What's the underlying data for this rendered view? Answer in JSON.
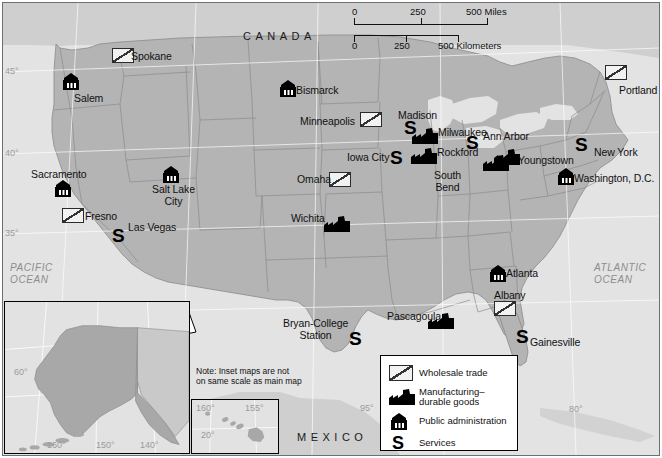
{
  "map": {
    "title": "United States employment-sector reference map",
    "regions": [
      {
        "name": "CANADA",
        "x": 243,
        "y": 30
      },
      {
        "name": "MEXICO",
        "x": 297,
        "y": 431
      }
    ],
    "oceans": [
      {
        "name": "PACIFIC\nOCEAN",
        "x": 10,
        "y": 262
      },
      {
        "name": "ATLANTIC\nOCEAN",
        "x": 594,
        "y": 262
      }
    ],
    "graticule_labels": [
      {
        "text": "45°",
        "x": 5,
        "y": 66
      },
      {
        "text": "40°",
        "x": 5,
        "y": 148
      },
      {
        "text": "35°",
        "x": 5,
        "y": 228
      },
      {
        "text": "95°",
        "x": 360,
        "y": 403
      },
      {
        "text": "80°",
        "x": 569,
        "y": 404
      }
    ],
    "colors": {
      "land": "#b4b4b4",
      "land_neighbor": "#cfcfcf",
      "water": "#e3e3e3",
      "border": "#8a8a8a",
      "symbol": "#000000"
    }
  },
  "scalebar": {
    "miles": {
      "zero": "0",
      "mid": "250",
      "end": "500 Miles"
    },
    "kilometers": {
      "zero": "0",
      "mid": "250",
      "end": "500 Kilometers"
    }
  },
  "legend": {
    "items": [
      {
        "icon": "wholesale-trade-icon",
        "label": "Wholesale trade"
      },
      {
        "icon": "manufacturing-durable-goods-icon",
        "label": "Manufacturing–\ndurable goods"
      },
      {
        "icon": "public-administration-icon",
        "label": "Public administration"
      },
      {
        "icon": "services-icon",
        "label": "Services"
      }
    ]
  },
  "insets": {
    "note": "Note: Inset maps are not\non same scale as main map",
    "alaska": {
      "name": "Alaska",
      "graticule_labels": [
        {
          "text": "60°",
          "x": 14,
          "y": 367
        },
        {
          "text": "160°",
          "x": 47,
          "y": 440
        },
        {
          "text": "150°",
          "x": 96,
          "y": 440
        },
        {
          "text": "140°",
          "x": 140,
          "y": 440
        }
      ]
    },
    "hawaii": {
      "name": "Hawaii",
      "graticule_labels": [
        {
          "text": "160°",
          "x": 196,
          "y": 403
        },
        {
          "text": "155°",
          "x": 245,
          "y": 403
        },
        {
          "text": "20°",
          "x": 201,
          "y": 430
        }
      ]
    }
  },
  "cities": [
    {
      "name": "Spokane",
      "category": "wholesale",
      "label_x": 131,
      "label_y": 51,
      "sym_x": 112,
      "sym_y": 48
    },
    {
      "name": "Salem",
      "category": "public",
      "label_x": 74,
      "label_y": 93,
      "sym_x": 61,
      "sym_y": 73
    },
    {
      "name": "Portland",
      "category": "wholesale",
      "label_x": 619,
      "label_y": 85,
      "sym_x": 605,
      "sym_y": 65
    },
    {
      "name": "Bismarck",
      "category": "public",
      "label_x": 296,
      "label_y": 85,
      "sym_x": 278,
      "sym_y": 80
    },
    {
      "name": "Minneapolis",
      "category": "wholesale",
      "label_x": 300,
      "label_y": 116,
      "sym_x": 360,
      "sym_y": 112
    },
    {
      "name": "Madison",
      "category": "services",
      "label_x": 398,
      "label_y": 110,
      "sym_x": 404,
      "sym_y": 118
    },
    {
      "name": "Milwaukee",
      "category": "manufacturing",
      "label_x": 438,
      "label_y": 127,
      "sym_x": 412,
      "sym_y": 128
    },
    {
      "name": "Ann Arbor",
      "category": "services",
      "label_x": 483,
      "label_y": 131,
      "sym_x": 466,
      "sym_y": 133
    },
    {
      "name": "New York",
      "category": "services",
      "label_x": 594,
      "label_y": 147,
      "sym_x": 575,
      "sym_y": 135
    },
    {
      "name": "Iowa City",
      "category": "services",
      "label_x": 347,
      "label_y": 152,
      "sym_x": 390,
      "sym_y": 148
    },
    {
      "name": "Rockford",
      "category": "manufacturing",
      "label_x": 437,
      "label_y": 147,
      "sym_x": 411,
      "sym_y": 148
    },
    {
      "name": "Youngstown",
      "category": "manufacturing",
      "label_x": 518,
      "label_y": 155,
      "sym_x": 494,
      "sym_y": 149
    },
    {
      "name": "Omaha",
      "category": "wholesale",
      "label_x": 297,
      "label_y": 174,
      "sym_x": 329,
      "sym_y": 172
    },
    {
      "name": "Washington, D.C.",
      "category": "public",
      "label_x": 574,
      "label_y": 173,
      "sym_x": 556,
      "sym_y": 168
    },
    {
      "name": "South\nBend",
      "category": "manufacturing",
      "label_x": 434,
      "label_y": 170,
      "sym_x": 483,
      "sym_y": 155
    },
    {
      "name": "Sacramento",
      "category": "public",
      "label_x": 31,
      "label_y": 169,
      "sym_x": 53,
      "sym_y": 180
    },
    {
      "name": "Salt Lake\nCity",
      "category": "public",
      "label_x": 152,
      "label_y": 184,
      "sym_x": 161,
      "sym_y": 166
    },
    {
      "name": "Fresno",
      "category": "wholesale",
      "label_x": 85,
      "label_y": 211,
      "sym_x": 62,
      "sym_y": 208
    },
    {
      "name": "Las Vegas",
      "category": "services",
      "label_x": 128,
      "label_y": 222,
      "sym_x": 112,
      "sym_y": 226
    },
    {
      "name": "Wichita",
      "category": "manufacturing",
      "label_x": 291,
      "label_y": 213,
      "sym_x": 324,
      "sym_y": 216
    },
    {
      "name": "Atlanta",
      "category": "public",
      "label_x": 506,
      "label_y": 268,
      "sym_x": 488,
      "sym_y": 265
    },
    {
      "name": "Albany",
      "category": "wholesale",
      "label_x": 494,
      "label_y": 290,
      "sym_x": 494,
      "sym_y": 301
    },
    {
      "name": "Pascagoula",
      "category": "manufacturing",
      "label_x": 387,
      "label_y": 311,
      "sym_x": 428,
      "sym_y": 313
    },
    {
      "name": "Bryan-College\nStation",
      "category": "services",
      "label_x": 283,
      "label_y": 318,
      "sym_x": 349,
      "sym_y": 329
    },
    {
      "name": "Gainesville",
      "category": "services",
      "label_x": 530,
      "label_y": 337,
      "sym_x": 516,
      "sym_y": 327
    }
  ]
}
